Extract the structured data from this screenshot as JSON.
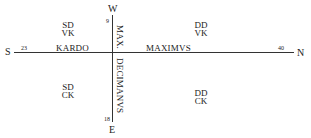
{
  "directions": {
    "west": "W",
    "east": "E",
    "south": "S",
    "north": "N"
  },
  "axes": {
    "horizontal": {
      "left_label": "KARDO",
      "right_label": "MAXIMVS",
      "left_number": "23",
      "right_number": "40"
    },
    "vertical": {
      "top_label": "MAX.",
      "bottom_label": "DECIMANVS",
      "top_number": "9",
      "bottom_number": "18"
    }
  },
  "quadrants": {
    "top_left": {
      "line1": "SD",
      "line2": "VK"
    },
    "top_right": {
      "line1": "DD",
      "line2": "VK"
    },
    "bottom_left": {
      "line1": "SD",
      "line2": "CK"
    },
    "bottom_right": {
      "line1": "DD",
      "line2": "CK"
    }
  },
  "colors": {
    "line": "#333333",
    "text": "#222222",
    "background": "#ffffff"
  }
}
